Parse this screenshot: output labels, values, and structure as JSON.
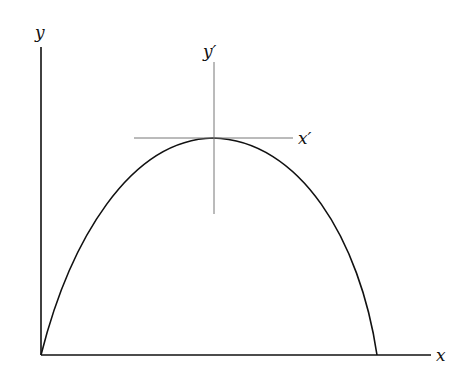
{
  "diagram": {
    "labels": {
      "y_axis": "y",
      "x_axis": "x",
      "y_prime": "y′",
      "x_prime": "x′"
    },
    "colors": {
      "axes": "#111111",
      "curve": "#111111",
      "translated_axes": "#777777"
    }
  }
}
